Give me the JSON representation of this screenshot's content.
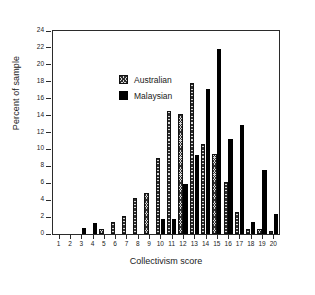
{
  "chart_data": {
    "type": "bar",
    "title": "",
    "xlabel": "Collectivism score",
    "ylabel": "Percent of sample",
    "categories": [
      1,
      2,
      3,
      4,
      5,
      6,
      7,
      8,
      9,
      10,
      11,
      12,
      13,
      14,
      15,
      16,
      17,
      18,
      19,
      20
    ],
    "xtick_labels": [
      "1",
      "2",
      "3",
      "4",
      "5",
      "6",
      "7",
      "8",
      "9",
      "10",
      "11",
      "12",
      "13",
      "14",
      "15",
      "16",
      "17",
      "18",
      "19",
      "20"
    ],
    "ytick_labels": [
      "0",
      "2",
      "4",
      "6",
      "8",
      "10",
      "12",
      "14",
      "16",
      "18",
      "20",
      "22",
      "24"
    ],
    "ytick_values": [
      0,
      2,
      4,
      6,
      8,
      10,
      12,
      14,
      16,
      18,
      20,
      22,
      24
    ],
    "ylim": [
      0,
      24
    ],
    "xlim": [
      0.4,
      20.6
    ],
    "grid": false,
    "legend_position": "upper-left inside axes",
    "series": [
      {
        "name": "Australian",
        "style": "hatched",
        "color": "#d8d8d8",
        "values": [
          0,
          0,
          0,
          0,
          0.6,
          1.4,
          2.1,
          4.3,
          4.9,
          9.0,
          14.5,
          14.2,
          17.9,
          10.6,
          9.5,
          6.1,
          2.6,
          0.6,
          0.6,
          0.4
        ]
      },
      {
        "name": "Malaysian",
        "style": "solid",
        "color": "#000000",
        "values": [
          0,
          0,
          0.7,
          1.3,
          0,
          0,
          0,
          0,
          0,
          1.8,
          1.8,
          5.9,
          9.3,
          17.1,
          21.9,
          11.2,
          12.9,
          1.4,
          7.6,
          2.4
        ]
      }
    ]
  },
  "legend": {
    "items": [
      {
        "label": "Australian",
        "style": "hatched"
      },
      {
        "label": "Malaysian",
        "style": "solid"
      }
    ]
  },
  "axes": {
    "x_title": "Collectivism score",
    "y_title": "Percent of sample"
  }
}
